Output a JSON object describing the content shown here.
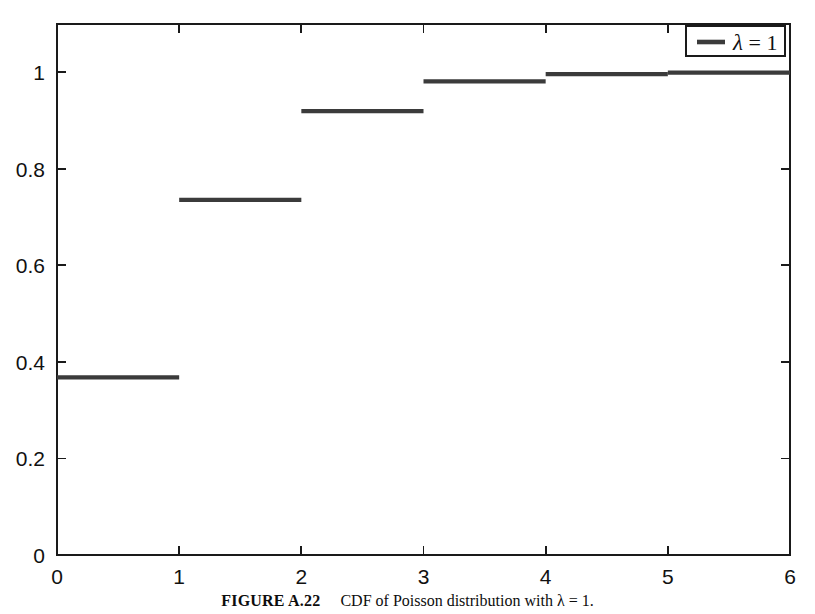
{
  "figure": {
    "caption_label": "FIGURE A.22",
    "caption_text": "CDF of Poisson distribution with λ = 1."
  },
  "legend": {
    "entries": [
      {
        "label": "λ = 1",
        "symbol": "λ",
        "relation": "= 1",
        "color": "#3b3b3b"
      }
    ],
    "position": "top-right",
    "border_color": "#1a1a1a"
  },
  "colors": {
    "line": "#3b3b3b",
    "axis": "#1a1a1a",
    "background": "#ffffff"
  },
  "chart_data": {
    "type": "line",
    "subtype": "step-post",
    "title": "",
    "subtitle": "",
    "xlabel": "",
    "ylabel": "",
    "xlim": [
      0,
      6
    ],
    "ylim": [
      0,
      1.1
    ],
    "grid": false,
    "legend_position": "top-right",
    "xticks": [
      0,
      1,
      2,
      3,
      4,
      5,
      6
    ],
    "xticklabels": [
      "0",
      "1",
      "2",
      "3",
      "4",
      "5",
      "6"
    ],
    "yticks": [
      0,
      0.2,
      0.4,
      0.6,
      0.8,
      1
    ],
    "yticklabels": [
      "0",
      "0.2",
      "0.4",
      "0.6",
      "0.8",
      "1"
    ],
    "series": [
      {
        "name": "λ = 1",
        "color": "#3b3b3b",
        "x": [
          0,
          1,
          2,
          3,
          4,
          5,
          6
        ],
        "values": [
          0.3679,
          0.7358,
          0.9197,
          0.981,
          0.9963,
          0.9994,
          0.9999
        ],
        "steps": [
          {
            "x_start": 0,
            "x_end": 1,
            "y": 0.3679
          },
          {
            "x_start": 1,
            "x_end": 2,
            "y": 0.7358
          },
          {
            "x_start": 2,
            "x_end": 3,
            "y": 0.9197
          },
          {
            "x_start": 3,
            "x_end": 4,
            "y": 0.981
          },
          {
            "x_start": 4,
            "x_end": 5,
            "y": 0.9963
          },
          {
            "x_start": 5,
            "x_end": 6,
            "y": 0.9994
          }
        ]
      }
    ]
  }
}
